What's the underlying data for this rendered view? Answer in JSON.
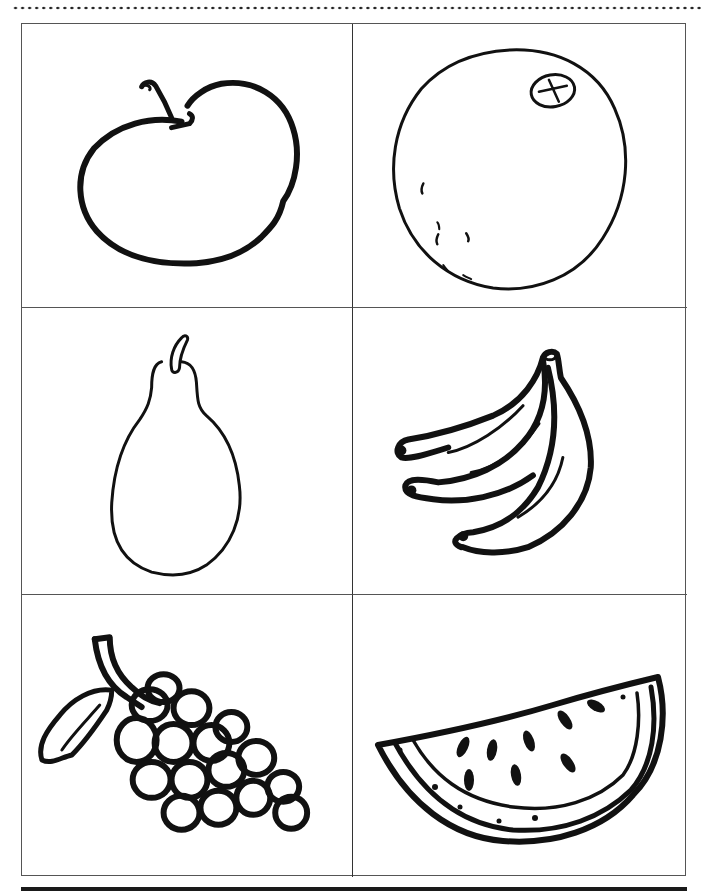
{
  "page": {
    "type": "fruit coloring worksheet",
    "line_color": "#111111",
    "grid": {
      "rows": 3,
      "columns": 2
    }
  },
  "cards": [
    {
      "fruit": "apple",
      "icon": "apple-icon"
    },
    {
      "fruit": "orange",
      "icon": "orange-icon"
    },
    {
      "fruit": "pear",
      "icon": "pear-icon"
    },
    {
      "fruit": "bananas",
      "icon": "banana-bunch-icon"
    },
    {
      "fruit": "grapes",
      "icon": "grape-bunch-icon"
    },
    {
      "fruit": "watermelon",
      "icon": "watermelon-slice-icon"
    }
  ]
}
